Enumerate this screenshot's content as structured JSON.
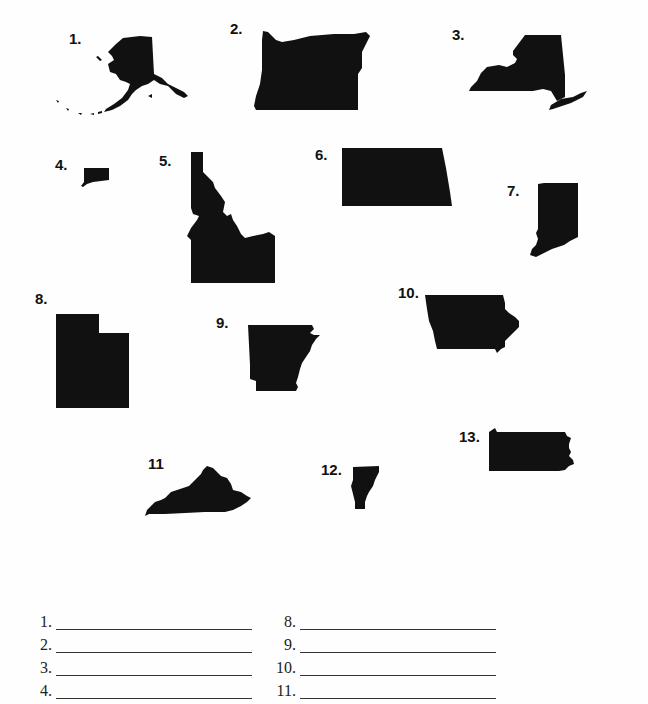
{
  "worksheet": {
    "shapes": [
      {
        "label": "1.",
        "state": "Alaska"
      },
      {
        "label": "2.",
        "state": "Oregon"
      },
      {
        "label": "3.",
        "state": "New York"
      },
      {
        "label": "4.",
        "state": "Connecticut"
      },
      {
        "label": "5.",
        "state": "Idaho"
      },
      {
        "label": "6.",
        "state": "North Dakota"
      },
      {
        "label": "7.",
        "state": "Indiana"
      },
      {
        "label": "8.",
        "state": "Utah"
      },
      {
        "label": "9.",
        "state": "Arkansas"
      },
      {
        "label": "10.",
        "state": "Iowa"
      },
      {
        "label": "11",
        "state": "Kentucky"
      },
      {
        "label": "12.",
        "state": "Vermont"
      },
      {
        "label": "13.",
        "state": "Pennsylvania"
      }
    ],
    "answer_lines": {
      "left": [
        {
          "label": "1.",
          "value": ""
        },
        {
          "label": "2.",
          "value": ""
        },
        {
          "label": "3.",
          "value": ""
        },
        {
          "label": "4.",
          "value": ""
        }
      ],
      "right": [
        {
          "label": "8.",
          "value": ""
        },
        {
          "label": "9.",
          "value": ""
        },
        {
          "label": "10.",
          "value": ""
        },
        {
          "label": "11.",
          "value": ""
        }
      ]
    }
  }
}
